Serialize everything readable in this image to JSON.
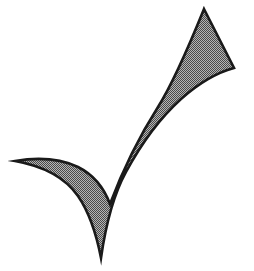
{
  "canvas": {
    "width": 254,
    "height": 271,
    "background_color": "#ffffff",
    "title": "Checkmark"
  },
  "graphic": {
    "name": "checkmark",
    "icon_name": "check-mark-icon",
    "label": "Check mark",
    "description": "Hand-drawn style check mark (tick) with a tapering upstroke and a curved swept left tail",
    "fill_color": "#808080",
    "fill_style": "dithered-halftone",
    "dither_light_color": "#b5b5b5",
    "dither_dark_color": "#4a4a4a",
    "outline_color": "#1a1a1a",
    "outline_width": 2.6,
    "key_points": {
      "top_right_apex": [
        204,
        9
      ],
      "right_corner": [
        234,
        68
      ],
      "bottom_vertex": [
        101,
        258
      ],
      "left_tail_tip": [
        15,
        161
      ],
      "inner_notch_apex": [
        101,
        200
      ]
    },
    "path": "M 204 9 L 234 68 C 219 72 199 83 181 99 C 160 118 140 146 126 172 C 115 192 107 216 101 258 C 96 232 89 212 78 196 C 64 176 43 166 15 161 C 39 157 61 159 78 167 C 94 175 104 188 110 204 C 122 172 139 137 158 107 C 173 83 189 46 204 9 Z"
  }
}
